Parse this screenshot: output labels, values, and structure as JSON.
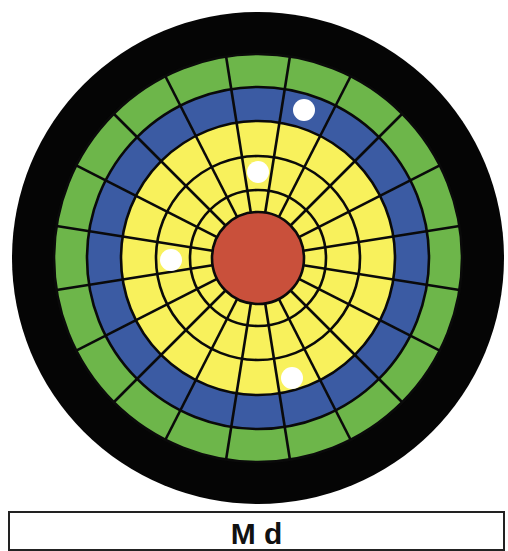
{
  "diagram": {
    "type": "concentric-target-diagram",
    "center": {
      "x": 258,
      "y": 258
    },
    "rings": [
      {
        "name": "outer-band",
        "radius": 246,
        "color": "#050505",
        "segmented": false
      },
      {
        "name": "green-ring",
        "radius": 204,
        "color": "#6db64a",
        "segmented": true
      },
      {
        "name": "blue-ring",
        "radius": 171,
        "color": "#3b5ba3",
        "segmented": true
      },
      {
        "name": "yellow-ring-3",
        "radius": 137,
        "color": "#f8f15c",
        "segmented": true
      },
      {
        "name": "yellow-ring-2",
        "radius": 102,
        "color": "#f8f15c",
        "segmented": true
      },
      {
        "name": "yellow-ring-1",
        "radius": 68,
        "color": "#f8f15c",
        "segmented": true
      },
      {
        "name": "center-core",
        "radius": 46,
        "color": "#c9503b",
        "segmented": false
      }
    ],
    "spokes": {
      "count": 20,
      "offset_deg": 9,
      "inner_radius": 46,
      "outer_radius": 204,
      "color": "#0a0a0a",
      "width": 2.6
    },
    "grid_line_color": "#0a0a0a",
    "markers": [
      {
        "label": "marker-1",
        "x": 304,
        "y": 110,
        "r": 11,
        "color": "#ffffff",
        "ring": "blue"
      },
      {
        "label": "marker-2",
        "x": 258,
        "y": 172,
        "r": 11,
        "color": "#ffffff",
        "ring": "yellow"
      },
      {
        "label": "marker-3",
        "x": 171,
        "y": 260,
        "r": 11,
        "color": "#ffffff",
        "ring": "yellow"
      },
      {
        "label": "marker-4",
        "x": 292,
        "y": 378,
        "r": 11,
        "color": "#ffffff",
        "ring": "yellow"
      }
    ]
  },
  "caption": {
    "text": "M d"
  }
}
